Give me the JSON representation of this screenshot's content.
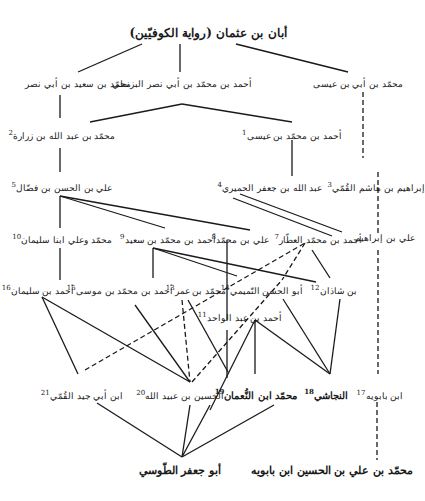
{
  "diagram": {
    "title": "أبان بن عثمان (رواية الكوفيّين)",
    "nodes": [
      {
        "id": "root",
        "label": "أبان بن عثمان (رواية الكوفيّين)",
        "num": ""
      },
      {
        "id": "r1a",
        "label": "محمّد بن سعيد بن أبي نصر",
        "num": ""
      },
      {
        "id": "r1b",
        "label": "أحمد بن محمّد بن أبي نصر البزنطي",
        "num": ""
      },
      {
        "id": "r1c",
        "label": "محمّد بن أبي بن عيسى",
        "num": ""
      },
      {
        "id": "n2",
        "label": "محمّد بن عبد الله بن زرارة",
        "num": "2"
      },
      {
        "id": "n1",
        "label": "أحمد بن محمّد بن عيسى",
        "num": "1"
      },
      {
        "id": "n5",
        "label": "علي بن الحسن بن فضّال",
        "num": "5"
      },
      {
        "id": "n4",
        "label": "عبد الله بن جعفر الحميري",
        "num": "4"
      },
      {
        "id": "n3",
        "label": "إبراهيم بن هاشم القُمّي",
        "num": "3"
      },
      {
        "id": "n10",
        "label": "محمّد وعلي ابنا سليمان",
        "num": "10"
      },
      {
        "id": "n9",
        "label": "أحمد بن محمّد بن سعيد",
        "num": "9"
      },
      {
        "id": "n8",
        "label": "علي بن محمّد",
        "num": "8"
      },
      {
        "id": "n7",
        "label": "أحمد بن محمّد العطّار",
        "num": "7"
      },
      {
        "id": "n6",
        "label": "علي بن إبراهيم",
        "num": ""
      },
      {
        "id": "n16",
        "label": "أحمد بن سليمان",
        "num": "16"
      },
      {
        "id": "n15",
        "label": "أحمد بن محمّد بن موسى",
        "num": "15"
      },
      {
        "id": "n13",
        "label": "محمّد بن عمر",
        "num": "13"
      },
      {
        "id": "n14",
        "label": "أبو الحسن التّميمي",
        "num": "14"
      },
      {
        "id": "n12",
        "label": "بن شاذان",
        "num": "12"
      },
      {
        "id": "n11",
        "label": "أحمد بن عبد الواحد",
        "num": "11"
      },
      {
        "id": "n21",
        "label": "ابن أبي جيد القُمّي",
        "num": "21"
      },
      {
        "id": "n20",
        "label": "الحسين بن عبيد الله",
        "num": "20"
      },
      {
        "id": "n19",
        "label": "محمّد ابن النُّعمان",
        "num": "19"
      },
      {
        "id": "n18",
        "label": "النجاشي",
        "num": "18"
      },
      {
        "id": "n17",
        "label": "ابن بابويه",
        "num": "17"
      },
      {
        "id": "tusi",
        "label": "أبو جعفر الطّوسي",
        "num": ""
      },
      {
        "id": "saduq",
        "label": "محمّد بن علي بن الحسين ابن بابويه",
        "num": ""
      }
    ]
  }
}
